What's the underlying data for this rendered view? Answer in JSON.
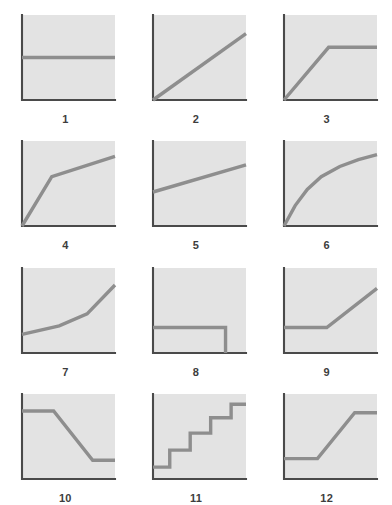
{
  "figure": {
    "kind": "panel-grid-of-line-charts",
    "rows": 4,
    "columns": 3,
    "panel_count": 12,
    "background_color": "#ffffff",
    "plot_area_color": "#e3e3e3",
    "axis_color": "#4a4a4a",
    "curve_color": "#8e8e8e",
    "caption_color": "#3d3d3d",
    "axes_shown": [
      "left",
      "bottom"
    ],
    "tick_labels": "none",
    "gridlines": false,
    "legend": "none"
  },
  "chart_data": [
    {
      "type": "line",
      "id": 1,
      "label": "1",
      "title": "",
      "xlabel": "",
      "ylabel": "",
      "xlim": [
        0,
        100
      ],
      "ylim": [
        0,
        100
      ],
      "shape_name": "constant-flat",
      "x": [
        0,
        100
      ],
      "y": [
        50,
        50
      ]
    },
    {
      "type": "line",
      "id": 2,
      "label": "2",
      "title": "",
      "xlabel": "",
      "ylabel": "",
      "xlim": [
        0,
        100
      ],
      "ylim": [
        0,
        100
      ],
      "shape_name": "linear-increase",
      "x": [
        0,
        100
      ],
      "y": [
        0,
        78
      ]
    },
    {
      "type": "line",
      "id": 3,
      "label": "3",
      "title": "",
      "xlabel": "",
      "ylabel": "",
      "xlim": [
        0,
        100
      ],
      "ylim": [
        0,
        100
      ],
      "shape_name": "rise-then-plateau",
      "x": [
        0,
        48,
        100
      ],
      "y": [
        0,
        62,
        62
      ]
    },
    {
      "type": "line",
      "id": 4,
      "label": "4",
      "title": "",
      "xlabel": "",
      "ylabel": "",
      "xlim": [
        0,
        100
      ],
      "ylim": [
        0,
        100
      ],
      "shape_name": "steep-then-gradual-increase",
      "x": [
        0,
        32,
        100
      ],
      "y": [
        0,
        58,
        82
      ]
    },
    {
      "type": "line",
      "id": 5,
      "label": "5",
      "title": "",
      "xlabel": "",
      "ylabel": "",
      "xlim": [
        0,
        100
      ],
      "ylim": [
        0,
        100
      ],
      "shape_name": "gentle-linear-increase",
      "x": [
        0,
        100
      ],
      "y": [
        40,
        72
      ]
    },
    {
      "type": "line",
      "id": 6,
      "label": "6",
      "title": "",
      "xlabel": "",
      "ylabel": "",
      "xlim": [
        0,
        100
      ],
      "ylim": [
        0,
        100
      ],
      "shape_name": "logarithmic-concave-increase",
      "x": [
        0,
        12,
        25,
        40,
        60,
        80,
        100
      ],
      "y": [
        0,
        24,
        43,
        58,
        70,
        78,
        84
      ]
    },
    {
      "type": "line",
      "id": 7,
      "label": "7",
      "title": "",
      "xlabel": "",
      "ylabel": "",
      "xlim": [
        0,
        100
      ],
      "ylim": [
        0,
        100
      ],
      "shape_name": "convex-accelerating-increase",
      "x": [
        0,
        40,
        70,
        100
      ],
      "y": [
        22,
        32,
        46,
        80
      ]
    },
    {
      "type": "line",
      "id": 8,
      "label": "8",
      "title": "",
      "xlabel": "",
      "ylabel": "",
      "xlim": [
        0,
        100
      ],
      "ylim": [
        0,
        100
      ],
      "shape_name": "flat-then-sudden-drop-to-zero",
      "x": [
        0,
        78,
        78
      ],
      "y": [
        30,
        30,
        0
      ]
    },
    {
      "type": "line",
      "id": 9,
      "label": "9",
      "title": "",
      "xlabel": "",
      "ylabel": "",
      "xlim": [
        0,
        100
      ],
      "ylim": [
        0,
        100
      ],
      "shape_name": "flat-then-linear-increase",
      "x": [
        0,
        46,
        100
      ],
      "y": [
        30,
        30,
        76
      ]
    },
    {
      "type": "line",
      "id": 10,
      "label": "10",
      "title": "",
      "xlabel": "",
      "ylabel": "",
      "xlim": [
        0,
        100
      ],
      "ylim": [
        0,
        100
      ],
      "shape_name": "high-plateau-decline-low-plateau",
      "x": [
        0,
        34,
        76,
        100
      ],
      "y": [
        80,
        80,
        22,
        22
      ]
    },
    {
      "type": "line",
      "id": 11,
      "label": "11",
      "title": "",
      "xlabel": "",
      "ylabel": "",
      "xlim": [
        0,
        100
      ],
      "ylim": [
        0,
        100
      ],
      "shape_name": "rising-staircase-four-steps",
      "x": [
        0,
        18,
        18,
        40,
        40,
        62,
        62,
        84,
        84,
        100
      ],
      "y": [
        14,
        14,
        34,
        34,
        54,
        54,
        72,
        72,
        88,
        88
      ]
    },
    {
      "type": "line",
      "id": 12,
      "label": "12",
      "title": "",
      "xlabel": "",
      "ylabel": "",
      "xlim": [
        0,
        100
      ],
      "ylim": [
        0,
        100
      ],
      "shape_name": "s-curve-flat-rise-plateau",
      "x": [
        0,
        36,
        76,
        100
      ],
      "y": [
        24,
        24,
        78,
        78
      ]
    }
  ]
}
